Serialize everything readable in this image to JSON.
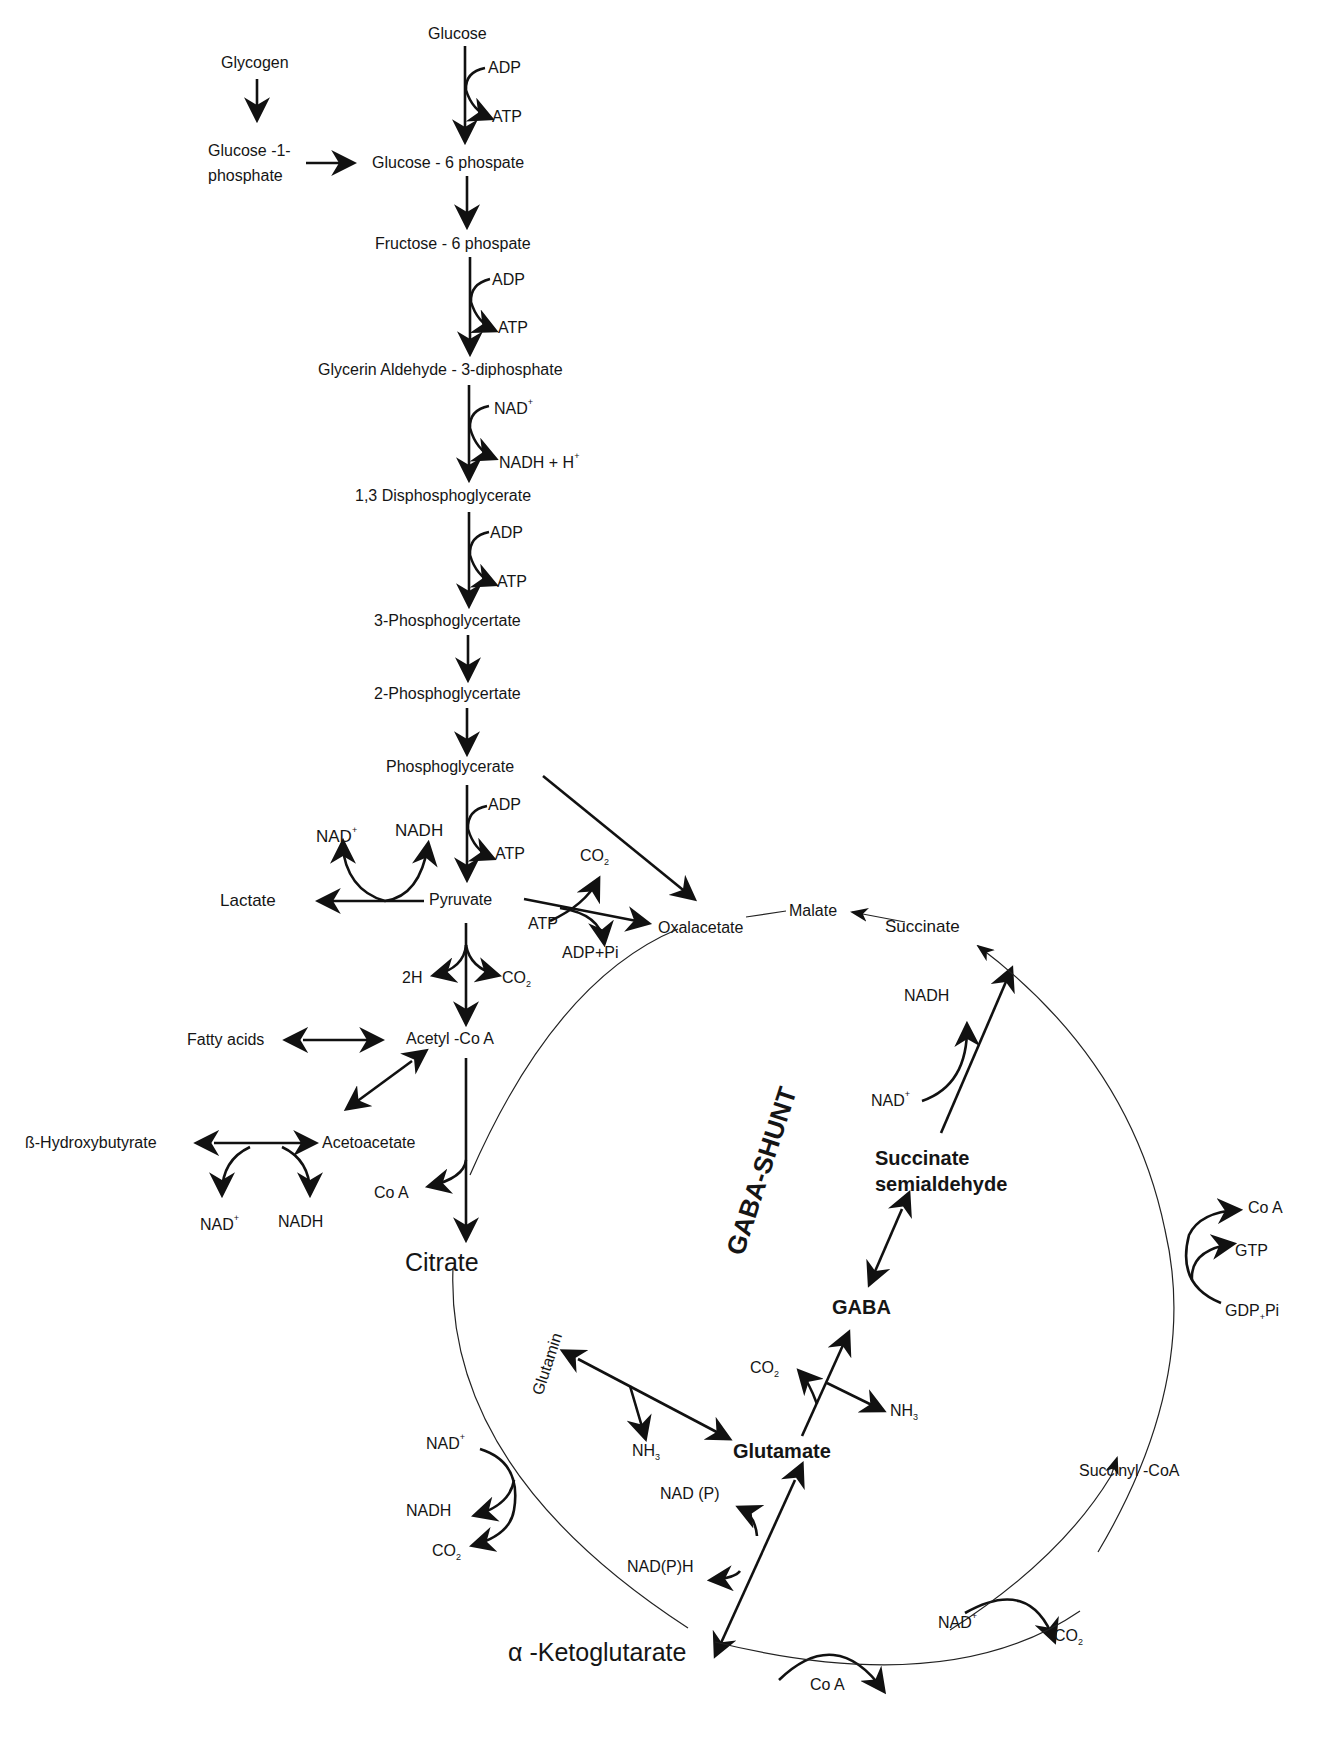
{
  "diagram": {
    "title_bold_center": "GABA-SHUNT",
    "glycolysis": {
      "glucose": "Glucose",
      "glycogen": "Glycogen",
      "glucose_1_phosphate_line1": "Glucose -1-",
      "glucose_1_phosphate_line2": "phosphate",
      "glucose_6_phosphate": "Glucose - 6 phospate",
      "fructose_6_phosphate": "Fructose - 6 phospate",
      "glycerin_aldehyde": "Glycerin Aldehyde - 3-diphosphate",
      "disphosphoglycerate": "1,3 Disphosphoglycerate",
      "phosphoglycertate_3": "3-Phosphoglycertate",
      "phosphoglycertate_2": "2-Phosphoglycertate",
      "phosphoglycerate": "Phosphoglycerate",
      "pyruvate": "Pyruvate",
      "lactate": "Lactate",
      "acetyl_coa": "Acetyl -Co A",
      "citrate": "Citrate"
    },
    "cofactors": {
      "adp": "ADP",
      "atp": "ATP",
      "nad": "NAD",
      "nadh": "NADH",
      "nadh_h": "NADH + H",
      "plus": "+",
      "co2": "CO",
      "sub2": "2",
      "h2": "2H",
      "adp_pi": "ADP+Pi",
      "coa": "Co A",
      "gtp": "GTP",
      "gdp": "GDP",
      "gdp_plus": "+",
      "pi": "Pi",
      "nh3": "NH",
      "sub3": "3",
      "nadp": "NAD (P)",
      "nadph": "NAD(P)H"
    },
    "ketone": {
      "fatty_acids": "Fatty acids",
      "hydroxybutyrate": "ß-Hydroxybutyrate",
      "acetoacetate": "Acetoacetate"
    },
    "tca_cycle": {
      "oxalacetate": "Oxalacetate",
      "malate": "Malate",
      "succinate": "Succinate",
      "succinyl_coa": "Succinyl -CoA",
      "alpha_symbol": "α",
      "ketoglutarate": " -Ketoglutarate"
    },
    "gaba_shunt": {
      "succinate_semialdehyde_line1": "Succinate",
      "succinate_semialdehyde_line2": "semialdehyde",
      "gaba": "GABA",
      "glutamate": "Glutamate",
      "glutamin": "Glutamin"
    },
    "colors": {
      "ink": "#111111",
      "background": "#ffffff"
    }
  }
}
